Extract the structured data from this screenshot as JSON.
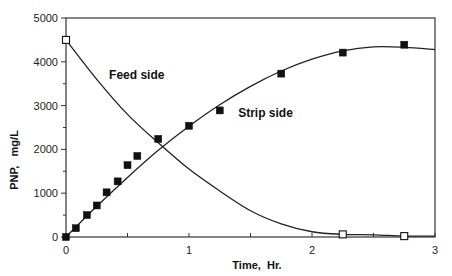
{
  "chart_data": {
    "type": "scatter",
    "title": "",
    "xlabel": "Time,  Hr.",
    "ylabel": "PNP,   mg/L",
    "xlim": [
      0,
      3
    ],
    "ylim": [
      0,
      5000
    ],
    "xticks": [
      0,
      1,
      2,
      3
    ],
    "xtick_labels": [
      "0",
      "1",
      "2",
      "3"
    ],
    "x_minor_step": 0.5,
    "yticks": [
      0,
      1000,
      2000,
      3000,
      4000,
      5000
    ],
    "ytick_labels": [
      "0",
      "1000",
      "2000",
      "3000",
      "4000",
      "5000"
    ],
    "y_minor_step": 500,
    "grid": false,
    "legend": "none",
    "annotations": [
      {
        "text": "Feed side",
        "x": 0.35,
        "y": 3700
      },
      {
        "text": "Strip side",
        "x": 1.4,
        "y": 2820
      }
    ],
    "series": [
      {
        "name": "Feed side",
        "marker": "open-square",
        "x": [
          0,
          2.25,
          2.75
        ],
        "y": [
          4500,
          60,
          20
        ],
        "fit_curve": {
          "x": [
            0,
            0.25,
            0.5,
            0.75,
            1.0,
            1.25,
            1.5,
            1.75,
            2.0,
            2.25,
            2.5,
            2.75,
            3.0
          ],
          "y": [
            4500,
            3600,
            2800,
            2150,
            1550,
            1050,
            600,
            300,
            120,
            60,
            50,
            20,
            20
          ]
        }
      },
      {
        "name": "Strip side",
        "marker": "filled-square",
        "x": [
          0,
          0.08,
          0.17,
          0.25,
          0.33,
          0.42,
          0.5,
          0.58,
          0.75,
          1.0,
          1.25,
          1.75,
          2.25,
          2.75
        ],
        "y": [
          0,
          200,
          500,
          720,
          1020,
          1270,
          1640,
          1850,
          2240,
          2540,
          2890,
          3730,
          4210,
          4390
        ],
        "fit_curve": {
          "x": [
            0,
            0.25,
            0.5,
            0.75,
            1.0,
            1.25,
            1.5,
            1.75,
            2.0,
            2.25,
            2.5,
            2.75,
            3.0
          ],
          "y": [
            0,
            700,
            1360,
            1980,
            2530,
            3020,
            3440,
            3790,
            4060,
            4250,
            4340,
            4330,
            4280
          ]
        }
      }
    ]
  }
}
